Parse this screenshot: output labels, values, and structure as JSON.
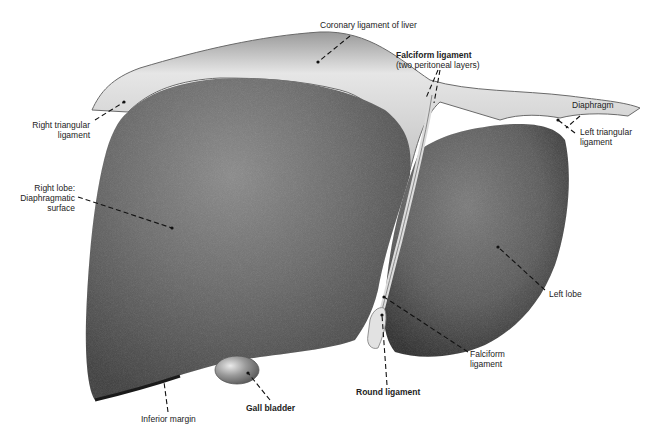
{
  "figure": {
    "colors": {
      "background": "#ffffff",
      "liver_dark": "#4a4a4a",
      "liver_mid": "#6a6a6a",
      "liver_highlight": "#8c8c8c",
      "ligament": "#d8d8d8",
      "ligament_shadow": "#9a9a9a",
      "label_text": "#222222",
      "leader_line": "#111111"
    },
    "labels": [
      {
        "id": "coronary",
        "lines": [
          "Coronary ligament of liver"
        ],
        "bold": false
      },
      {
        "id": "falciform_top",
        "lines": [
          "Falciform ligament"
        ],
        "bold": true
      },
      {
        "id": "falciform_top_sub",
        "lines": [
          "(two peritoneal layers)"
        ],
        "bold": false
      },
      {
        "id": "diaphragm",
        "lines": [
          "Diaphragm"
        ],
        "bold": false
      },
      {
        "id": "right_triangular",
        "lines": [
          "Right triangular",
          "ligament"
        ],
        "bold": false
      },
      {
        "id": "left_triangular",
        "lines": [
          "Left triangular",
          "ligament"
        ],
        "bold": false
      },
      {
        "id": "right_lobe",
        "lines": [
          "Right lobe:",
          "Diaphragmatic",
          "surface"
        ],
        "bold": false
      },
      {
        "id": "left_lobe",
        "lines": [
          "Left lobe"
        ],
        "bold": false
      },
      {
        "id": "falciform_bottom",
        "lines": [
          "Falciform",
          "ligament"
        ],
        "bold": false
      },
      {
        "id": "round_ligament",
        "lines": [
          "Round ligament"
        ],
        "bold": true
      },
      {
        "id": "gall_bladder",
        "lines": [
          "Gall bladder"
        ],
        "bold": true
      },
      {
        "id": "inferior_margin",
        "lines": [
          "Inferior margin"
        ],
        "bold": false
      }
    ]
  },
  "text": {
    "coronary": "Coronary ligament of liver",
    "falciform_title": "Falciform ligament",
    "falciform_sub": "(two peritoneal layers)",
    "diaphragm": "Diaphragm",
    "right_tri_1": "Right triangular",
    "right_tri_2": "ligament",
    "left_tri_1": "Left triangular",
    "left_tri_2": "ligament",
    "right_lobe_1": "Right lobe:",
    "right_lobe_2": "Diaphragmatic",
    "right_lobe_3": "surface",
    "left_lobe": "Left lobe",
    "falciform_b1": "Falciform",
    "falciform_b2": "ligament",
    "round_ligament": "Round ligament",
    "gall_bladder": "Gall bladder",
    "inferior_margin": "Inferior margin"
  }
}
